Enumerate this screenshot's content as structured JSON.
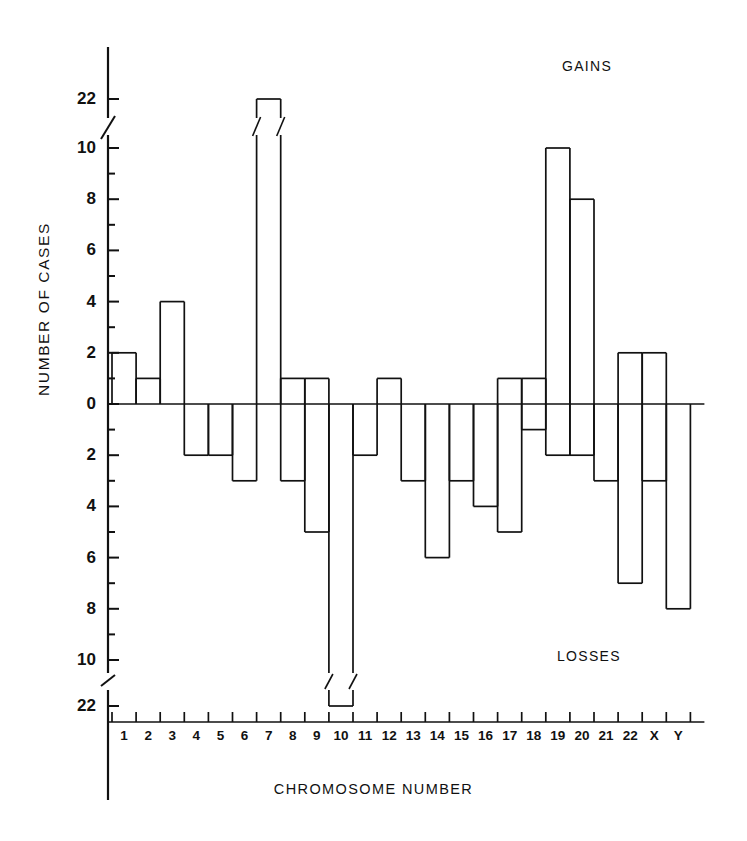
{
  "chart_data": {
    "type": "bar",
    "title": "",
    "xlabel": "CHROMOSOME  NUMBER",
    "ylabel": "NUMBER  OF  CASES",
    "annotations": [
      "GAINS",
      "LOSSES"
    ],
    "categories": [
      "1",
      "2",
      "3",
      "4",
      "5",
      "6",
      "7",
      "8",
      "9",
      "10",
      "11",
      "12",
      "13",
      "14",
      "15",
      "16",
      "17",
      "18",
      "19",
      "20",
      "21",
      "22",
      "X",
      "Y"
    ],
    "series": [
      {
        "name": "GAINS",
        "values": [
          2,
          1,
          4,
          0,
          0,
          0,
          22,
          1,
          1,
          0,
          0,
          1,
          0,
          0,
          0,
          0,
          1,
          1,
          10,
          8,
          0,
          2,
          2,
          0
        ]
      },
      {
        "name": "LOSSES",
        "values": [
          0,
          0,
          0,
          2,
          2,
          3,
          0,
          3,
          5,
          22,
          2,
          0,
          3,
          6,
          3,
          4,
          5,
          1,
          2,
          2,
          3,
          7,
          3,
          8
        ]
      }
    ],
    "ytick_labels_gains": [
      "22",
      "10",
      "8",
      "6",
      "4",
      "2",
      "0"
    ],
    "ytick_labels_losses": [
      "2",
      "4",
      "6",
      "8",
      "10",
      "22"
    ],
    "ylim": [
      -22,
      22
    ],
    "axis_break": true,
    "axis_break_note": "scale break between 10 and 22 on both gain and loss sides",
    "grid": false,
    "legend": "none"
  },
  "axes": {
    "y_title": "NUMBER  OF  CASES",
    "x_title": "CHROMOSOME  NUMBER"
  },
  "labels": {
    "gains": "GAINS",
    "losses": "LOSSES"
  },
  "colors": {
    "line": "#111111",
    "background": "#ffffff"
  }
}
